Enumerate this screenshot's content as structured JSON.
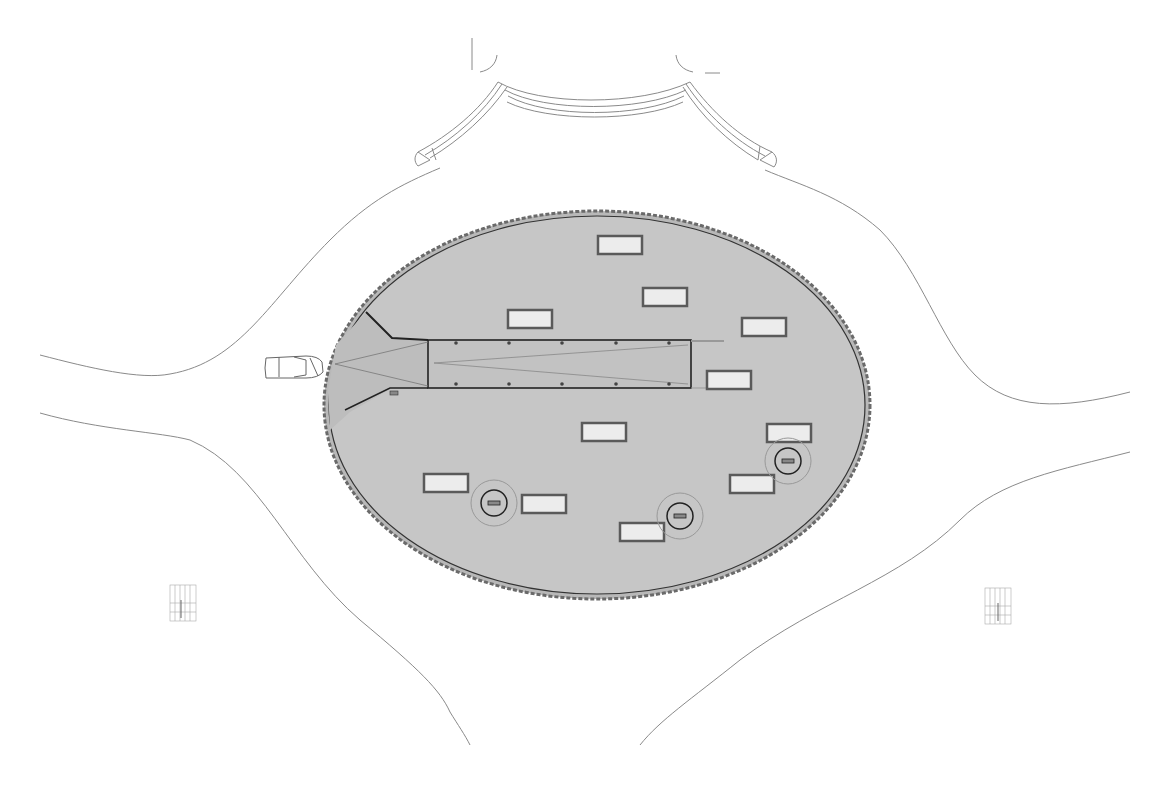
{
  "drawing": {
    "type": "site-plan",
    "background": "#ffffff",
    "line_color": "#8a8a8a",
    "plaza_fill": "#c4c4c4",
    "plaza_edge_color": "#555555",
    "bench_fill": "#ececec",
    "bench_stroke": "#5a5a5a",
    "ramp_stroke": "#222222"
  },
  "plaza": {
    "cx": 597,
    "cy": 405,
    "rx": 272,
    "ry": 193
  },
  "ramp": {
    "x": 428,
    "y": 340,
    "width": 263,
    "height": 48,
    "posts_x": [
      456,
      509,
      562,
      616,
      669
    ]
  },
  "benches": [
    {
      "x": 598,
      "y": 236,
      "w": 44,
      "h": 18
    },
    {
      "x": 643,
      "y": 288,
      "w": 44,
      "h": 18
    },
    {
      "x": 508,
      "y": 310,
      "w": 44,
      "h": 18
    },
    {
      "x": 742,
      "y": 318,
      "w": 44,
      "h": 18
    },
    {
      "x": 707,
      "y": 371,
      "w": 44,
      "h": 18
    },
    {
      "x": 582,
      "y": 423,
      "w": 44,
      "h": 18
    },
    {
      "x": 767,
      "y": 424,
      "w": 44,
      "h": 18
    },
    {
      "x": 424,
      "y": 474,
      "w": 44,
      "h": 18
    },
    {
      "x": 730,
      "y": 475,
      "w": 44,
      "h": 18
    },
    {
      "x": 522,
      "y": 495,
      "w": 44,
      "h": 18
    },
    {
      "x": 620,
      "y": 523,
      "w": 44,
      "h": 18
    }
  ],
  "lamps": [
    {
      "cx": 494,
      "cy": 503
    },
    {
      "cx": 680,
      "cy": 516
    },
    {
      "cx": 788,
      "cy": 461
    }
  ],
  "car": {
    "x": 264,
    "y": 355,
    "w": 58,
    "h": 22
  },
  "grid_markers": [
    {
      "x": 170,
      "y": 585
    },
    {
      "x": 985,
      "y": 588
    }
  ]
}
